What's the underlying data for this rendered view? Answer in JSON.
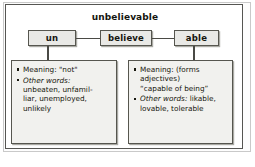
{
  "diagram": {
    "title": "unbelievable",
    "type": "word-parts-diagram",
    "colors": {
      "frame": "#555552",
      "box_fill": "#e9e9e6",
      "detail_fill": "#f1f1ee",
      "text": "#15150f",
      "connector": "#4a4a45"
    },
    "word_parts": [
      {
        "id": "prefix",
        "label": "un"
      },
      {
        "id": "root",
        "label": "believe"
      },
      {
        "id": "suffix",
        "label": "able"
      }
    ],
    "details": [
      {
        "id": "prefix-details",
        "for": "un",
        "bullets": [
          {
            "label": "Meaning:",
            "label_style": "plain",
            "value": " \"not\"",
            "continuation": []
          },
          {
            "label": "Other words:",
            "label_style": "italic",
            "value": "",
            "continuation": [
              "unbeaten, unfamil-",
              "liar, unemployed,",
              "unlikely"
            ]
          }
        ]
      },
      {
        "id": "suffix-details",
        "for": "able",
        "bullets": [
          {
            "label": "Meaning:",
            "label_style": "plain",
            "value": " (forms",
            "continuation": [
              "adjectives)",
              "“capable of being”"
            ]
          },
          {
            "label": "Other words:",
            "label_style": "italic",
            "value": " likable,",
            "continuation": [
              "lovable, tolerable"
            ]
          }
        ]
      }
    ]
  }
}
